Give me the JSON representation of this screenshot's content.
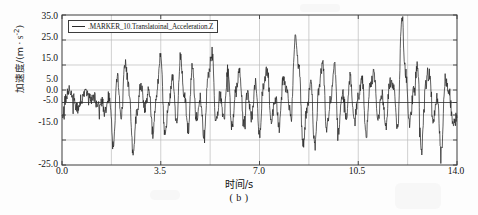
{
  "figure": {
    "caption": "( b )",
    "background_color": "#fdfdfd",
    "line_color": "#2a2a2a",
    "frame_color": "#3c3c3c",
    "grid_color": "#b9b9b9"
  },
  "legend": {
    "label": ".MARKER_10.Translatoinal_Acceleration.Z",
    "swatch_name": "line-swatch",
    "position": "top-left-inside"
  },
  "axes": {
    "x_title": "时间/s",
    "y_title_main": "加速度/(m",
    "y_title_unit": " · s",
    "y_title_exp": "-2",
    "y_title_close": ")",
    "y_title_full": "加速度/(m · s⁻²)",
    "x_ticks": [
      "0.0",
      "3.5",
      "7.0",
      "10.5",
      "14.0"
    ],
    "y_ticks": [
      "35.0",
      "25.0",
      "15.0",
      "5.0",
      "0.0",
      "-5.0",
      "-15.0",
      "-25.0"
    ]
  },
  "chart_data": {
    "type": "line",
    "title": "",
    "subtitle": "( b )",
    "xlabel": "时间/s",
    "ylabel": "加速度/(m · s⁻²)",
    "xlim": [
      0.0,
      14.0
    ],
    "ylim": [
      -25.0,
      35.0
    ],
    "xticks": [
      0.0,
      3.5,
      7.0,
      10.5,
      14.0
    ],
    "yticks": [
      35.0,
      25.0,
      15.0,
      5.0,
      0.0,
      -5.0,
      -15.0,
      -25.0
    ],
    "grid": true,
    "grid_x_minor_step": 1.75,
    "grid_y_lines": [
      35.0,
      25.0,
      15.0,
      5.0,
      0.0,
      -5.0,
      -15.0,
      -25.0
    ],
    "zero_line": 0.0,
    "legend": [
      ".MARKER_10.Translatoinal_Acceleration.Z"
    ],
    "legend_position": "upper left",
    "series": [
      {
        "name": ".MARKER_10.Translatoinal_Acceleration.Z",
        "color": "#2a2a2a",
        "description": "Noisy oscillatory vertical acceleration signal, roughly zero-mean, dominant band -10 to +15 m/s^2 with periodic spikes; notable peaks near t=9.2 s (~26), t=12.3 s (~34), minima near t=1.9 s (~-20) and t=13.3 s (~-20).",
        "sample_rate_hz": 50,
        "x": [
          0.0,
          0.14,
          0.28,
          0.42,
          0.56,
          0.7,
          0.84,
          0.98,
          1.12,
          1.26,
          1.4,
          1.54,
          1.68,
          1.82,
          1.96,
          2.1,
          2.24,
          2.38,
          2.52,
          2.66,
          2.8,
          2.94,
          3.08,
          3.22,
          3.36,
          3.5,
          3.64,
          3.78,
          3.92,
          4.06,
          4.2,
          4.34,
          4.48,
          4.62,
          4.76,
          4.9,
          5.04,
          5.18,
          5.32,
          5.46,
          5.6,
          5.74,
          5.88,
          6.02,
          6.16,
          6.3,
          6.44,
          6.58,
          6.72,
          6.86,
          7.0,
          7.14,
          7.28,
          7.42,
          7.56,
          7.7,
          7.84,
          7.98,
          8.12,
          8.26,
          8.4,
          8.54,
          8.68,
          8.82,
          8.96,
          9.1,
          9.24,
          9.38,
          9.52,
          9.66,
          9.8,
          9.94,
          10.08,
          10.22,
          10.36,
          10.5,
          10.64,
          10.78,
          10.92,
          11.06,
          11.2,
          11.34,
          11.48,
          11.62,
          11.76,
          11.9,
          12.04,
          12.18,
          12.32,
          12.46,
          12.6,
          12.74,
          12.88,
          13.02,
          13.16,
          13.3,
          13.44,
          13.58,
          13.72,
          13.86,
          14.0
        ],
        "y": [
          -7.0,
          2.0,
          6.0,
          1.0,
          -3.0,
          2.0,
          4.0,
          1.0,
          3.0,
          -2.0,
          1.0,
          -4.0,
          3.0,
          -16.0,
          10.0,
          -6.0,
          16.0,
          5.0,
          -20.0,
          -4.0,
          8.0,
          -2.0,
          5.0,
          -12.0,
          3.0,
          20.0,
          -13.0,
          -2.0,
          9.0,
          -8.0,
          18.0,
          3.0,
          -11.0,
          15.0,
          -6.0,
          2.0,
          -13.0,
          11.0,
          20.0,
          -9.0,
          3.0,
          -6.0,
          13.0,
          -10.0,
          5.0,
          12.0,
          -9.0,
          4.0,
          -6.0,
          8.0,
          -12.0,
          6.0,
          13.0,
          -8.0,
          2.0,
          -10.0,
          9.0,
          4.0,
          -6.0,
          26.0,
          15.0,
          -17.0,
          -3.0,
          9.0,
          -18.0,
          5.0,
          16.0,
          -10.0,
          2.0,
          15.0,
          -12.0,
          4.0,
          -5.0,
          10.0,
          -8.0,
          3.0,
          9.0,
          -13.0,
          6.0,
          12.0,
          -7.0,
          3.0,
          -9.0,
          8.0,
          5.0,
          -11.0,
          34.0,
          12.0,
          -8.0,
          4.0,
          14.0,
          -19.0,
          7.0,
          11.0,
          -6.0,
          2.0,
          -20.0,
          9.0,
          4.0,
          -9.0,
          -6.0
        ]
      }
    ]
  }
}
